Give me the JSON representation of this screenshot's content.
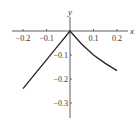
{
  "chart_data": {
    "type": "line",
    "title": "",
    "xlabel": "x",
    "ylabel": "y",
    "xlim": [
      -0.25,
      0.25
    ],
    "ylim": [
      -0.33,
      0.07
    ],
    "grid": false,
    "x_ticks": [
      {
        "value": -0.2,
        "label": "−0.2"
      },
      {
        "value": -0.1,
        "label": "−0.1"
      },
      {
        "value": 0.1,
        "label": "0.1"
      },
      {
        "value": 0.2,
        "label": "0.2"
      }
    ],
    "y_ticks": [
      {
        "value": -0.1,
        "label": "−0.1"
      },
      {
        "value": -0.2,
        "label": "−0.2"
      },
      {
        "value": -0.3,
        "label": "−0.3"
      }
    ],
    "series": [
      {
        "name": "curve",
        "color": "#222222",
        "points": [
          [
            -0.2,
            -0.24
          ],
          [
            -0.15,
            -0.18
          ],
          [
            -0.1,
            -0.12
          ],
          [
            -0.05,
            -0.06
          ],
          [
            0,
            0
          ],
          [
            0.05,
            -0.055
          ],
          [
            0.1,
            -0.1
          ],
          [
            0.15,
            -0.135
          ],
          [
            0.2,
            -0.165
          ]
        ]
      }
    ]
  }
}
